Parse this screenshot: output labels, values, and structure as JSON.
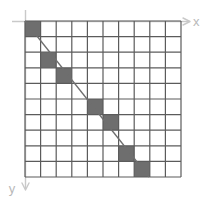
{
  "figure": {
    "axes": {
      "x": {
        "label": "x",
        "arrow_direction": "right",
        "color": "#c9c9c9"
      },
      "y": {
        "label": "y",
        "arrow_direction": "down",
        "color": "#c9c9c9"
      }
    },
    "grid": {
      "columns": 10,
      "rows": 10,
      "cell_size": 15.6,
      "origin_x": 25,
      "origin_y": 21,
      "line_color": "#5b5b5b",
      "cell_fill": "#ffffff"
    },
    "line": {
      "from_x": 25,
      "from_y": 21,
      "to_x": 149,
      "to_y": 177,
      "color": "#6e6e6e"
    }
  },
  "chart_data": {
    "type": "heatmap",
    "title": "",
    "xlabel": "x",
    "ylabel": "y",
    "grid": true,
    "legend": "none",
    "columns": 10,
    "rows": 10,
    "x": [
      0,
      1,
      2,
      3,
      4,
      5,
      6,
      7,
      8,
      9
    ],
    "y": [
      0,
      1,
      2,
      3,
      4,
      5,
      6,
      7,
      8,
      9
    ],
    "shaded_cells": [
      {
        "col": 0,
        "row": 0
      },
      {
        "col": 1,
        "row": 2
      },
      {
        "col": 2,
        "row": 3
      },
      {
        "col": 4,
        "row": 5
      },
      {
        "col": 5,
        "row": 6
      },
      {
        "col": 6,
        "row": 8
      },
      {
        "col": 7,
        "row": 9
      }
    ],
    "shaded_color": "#6e6e6e",
    "empty_color": "#ffffff",
    "overlay_line": {
      "x0": 0,
      "y0": 0,
      "x1": 8,
      "y1": 10
    }
  }
}
